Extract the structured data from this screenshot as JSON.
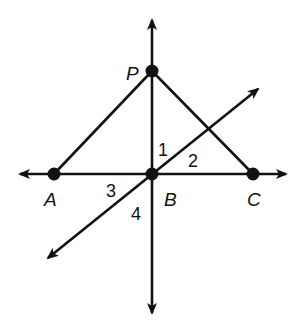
{
  "diagram": {
    "stroke_color": "#111111",
    "background": "#ffffff",
    "points": [
      {
        "id": "P",
        "label": "P",
        "x": 152,
        "y": 71,
        "label_x": 126,
        "label_y": 80
      },
      {
        "id": "A",
        "label": "A",
        "x": 54,
        "y": 174,
        "label_x": 44,
        "label_y": 206
      },
      {
        "id": "B",
        "label": "B",
        "x": 152,
        "y": 174,
        "label_x": 164,
        "label_y": 206
      },
      {
        "id": "C",
        "label": "C",
        "x": 253,
        "y": 174,
        "label_x": 247,
        "label_y": 206
      }
    ],
    "angles": [
      {
        "label": "1",
        "x": 158,
        "y": 156
      },
      {
        "label": "2",
        "x": 188,
        "y": 167
      },
      {
        "label": "3",
        "x": 106,
        "y": 197
      },
      {
        "label": "4",
        "x": 131,
        "y": 220
      }
    ],
    "lines": [
      {
        "name": "vertical-line-PB",
        "x1": 152,
        "y1": 20,
        "x2": 152,
        "y2": 313,
        "arrows": "both"
      },
      {
        "name": "horizontal-line-AC",
        "x1": 20,
        "y1": 174,
        "x2": 286,
        "y2": 174,
        "arrows": "both"
      },
      {
        "name": "diagonal-line-through-B",
        "x1": 48,
        "y1": 258,
        "x2": 258,
        "y2": 89,
        "arrows": "both"
      }
    ],
    "segments": [
      {
        "name": "segment-PA",
        "from": "P",
        "to": "A"
      },
      {
        "name": "segment-PC",
        "from": "P",
        "to": "C"
      }
    ]
  }
}
